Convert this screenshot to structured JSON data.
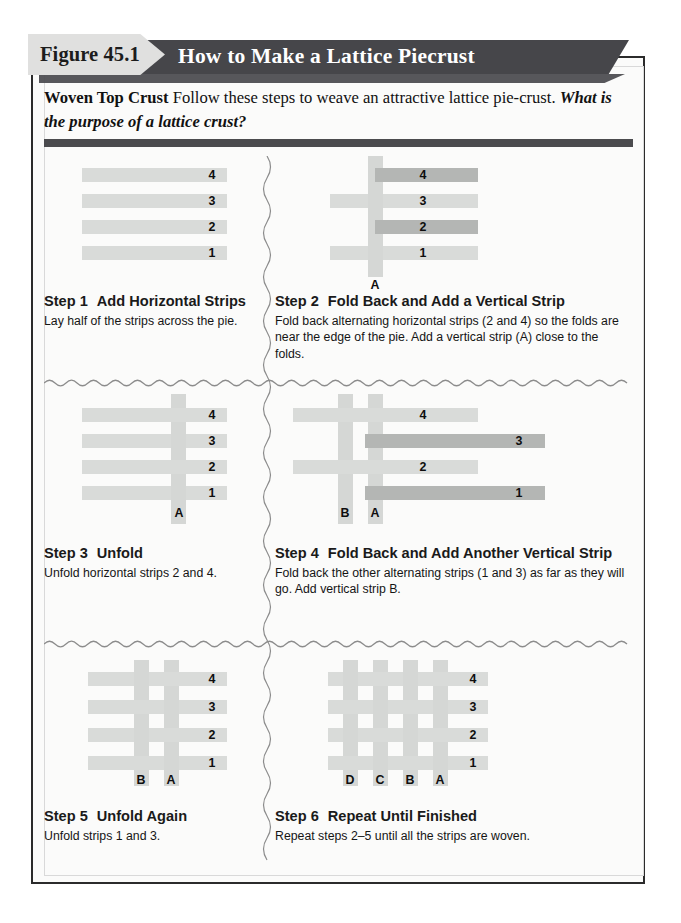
{
  "figure": {
    "tab_label": "Figure 45.1",
    "title": "How to Make a Lattice Piecrust"
  },
  "intro": {
    "lead": "Woven Top Crust",
    "text": " Follow these steps to weave an attractive lattice pie-crust. ",
    "question": "What is the purpose of a lattice crust?"
  },
  "colors": {
    "banner": "#46464a",
    "tab": "#e0e0df",
    "strip": "#d9dbd9",
    "strip_folded": "#b4b6b4",
    "strip_vertical": "#d5d7d5",
    "rule": "#4b4b4e",
    "page_border": "#2b2b2b"
  },
  "steps": [
    {
      "number": "Step 1",
      "title": "Add Horizontal Strips",
      "body": "Lay half of the strips across the pie.",
      "strip_labels": [
        "4",
        "3",
        "2",
        "1"
      ],
      "vertical_labels": []
    },
    {
      "number": "Step 2",
      "title": "Fold Back and Add a Vertical Strip",
      "body": "Fold back alternating horizontal strips (2 and 4) so the folds are near the edge of the pie. Add a vertical strip (A) close to the folds.",
      "strip_labels": [
        "4",
        "3",
        "2",
        "1"
      ],
      "vertical_labels": [
        "A"
      ],
      "folded_strips": [
        "2",
        "4"
      ]
    },
    {
      "number": "Step 3",
      "title": "Unfold",
      "body": "Unfold horizontal strips 2 and 4.",
      "strip_labels": [
        "4",
        "3",
        "2",
        "1"
      ],
      "vertical_labels": [
        "A"
      ]
    },
    {
      "number": "Step 4",
      "title": "Fold Back and Add Another Vertical Strip",
      "body": "Fold back the other alternating strips (1 and 3) as far as they will go. Add vertical strip B.",
      "strip_labels": [
        "4",
        "3",
        "2",
        "1"
      ],
      "vertical_labels": [
        "B",
        "A"
      ],
      "folded_strips": [
        "1",
        "3"
      ]
    },
    {
      "number": "Step 5",
      "title": "Unfold Again",
      "body": "Unfold strips 1 and 3.",
      "strip_labels": [
        "4",
        "3",
        "2",
        "1"
      ],
      "vertical_labels": [
        "B",
        "A"
      ]
    },
    {
      "number": "Step 6",
      "title": "Repeat Until Finished",
      "body": "Repeat steps 2–5 until all the strips are woven.",
      "strip_labels": [
        "4",
        "3",
        "2",
        "1"
      ],
      "vertical_labels": [
        "D",
        "C",
        "B",
        "A"
      ]
    }
  ]
}
